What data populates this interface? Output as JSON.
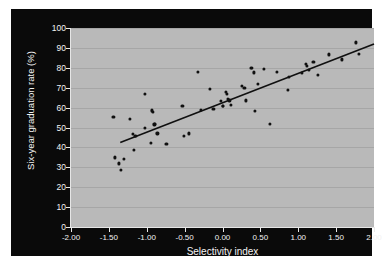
{
  "figure": {
    "background_color": "#ffffff",
    "panel_color": "#0a0a0a",
    "plot_background_color": "#b9b9b9",
    "gridline_color": "#a6a6a6",
    "text_color": "#f2f2f2",
    "marker_color": "#101010",
    "line_color": "#101010"
  },
  "chart_data": {
    "type": "scatter",
    "title": "",
    "xlabel": "Selectivity index",
    "ylabel": "Six-year graduation rate (%)",
    "xlim": [
      -2.0,
      2.0
    ],
    "ylim": [
      0,
      100
    ],
    "grid": true,
    "grid_axis": "y",
    "legend": null,
    "xticks": [
      -2.0,
      -1.5,
      -1.0,
      -0.5,
      0.0,
      0.5,
      1.0,
      1.5,
      2.0
    ],
    "xticklabels": [
      "-2.00",
      "-1.50",
      "-1.00",
      "-0.50",
      "0.00",
      "0.50",
      "1.00",
      "1.50",
      "2.00"
    ],
    "yticks": [
      0,
      10,
      20,
      30,
      40,
      50,
      60,
      70,
      80,
      90,
      100
    ],
    "yticklabels": [
      "0",
      "10",
      "20",
      "30",
      "40",
      "50",
      "60",
      "70",
      "80",
      "90",
      "100"
    ],
    "trendline": {
      "type": "linear-fit",
      "x_start": -1.35,
      "y_start": 42.5,
      "x_end": 2.0,
      "y_end": 92.0,
      "slope": 14.78,
      "intercept": 62.45
    },
    "points": [
      {
        "x": -1.44,
        "y": 55.5
      },
      {
        "x": -1.42,
        "y": 35.0
      },
      {
        "x": -1.37,
        "y": 32.0
      },
      {
        "x": -1.34,
        "y": 28.8
      },
      {
        "x": -1.3,
        "y": 34.3
      },
      {
        "x": -1.22,
        "y": 54.2
      },
      {
        "x": -1.18,
        "y": 46.8
      },
      {
        "x": -1.17,
        "y": 38.8
      },
      {
        "x": -1.16,
        "y": 45.6
      },
      {
        "x": -1.14,
        "y": 45.8
      },
      {
        "x": -1.02,
        "y": 66.8
      },
      {
        "x": -1.02,
        "y": 49.6
      },
      {
        "x": -0.95,
        "y": 42.3
      },
      {
        "x": -0.93,
        "y": 58.6
      },
      {
        "x": -0.92,
        "y": 57.8
      },
      {
        "x": -0.9,
        "y": 51.6
      },
      {
        "x": -0.89,
        "y": 52.0
      },
      {
        "x": -0.86,
        "y": 47.0
      },
      {
        "x": -0.74,
        "y": 41.9
      },
      {
        "x": -0.53,
        "y": 61.0
      },
      {
        "x": -0.51,
        "y": 45.8
      },
      {
        "x": -0.44,
        "y": 47.0
      },
      {
        "x": -0.33,
        "y": 77.9
      },
      {
        "x": -0.29,
        "y": 58.7
      },
      {
        "x": -0.17,
        "y": 69.3
      },
      {
        "x": -0.12,
        "y": 59.2
      },
      {
        "x": -0.02,
        "y": 63.2
      },
      {
        "x": 0.0,
        "y": 61.0
      },
      {
        "x": 0.01,
        "y": 60.7
      },
      {
        "x": 0.04,
        "y": 67.7
      },
      {
        "x": 0.06,
        "y": 66.9
      },
      {
        "x": 0.07,
        "y": 64.2
      },
      {
        "x": 0.09,
        "y": 63.6
      },
      {
        "x": 0.11,
        "y": 61.2
      },
      {
        "x": 0.26,
        "y": 71.1
      },
      {
        "x": 0.29,
        "y": 69.9
      },
      {
        "x": 0.31,
        "y": 63.6
      },
      {
        "x": 0.37,
        "y": 79.8
      },
      {
        "x": 0.39,
        "y": 80.0
      },
      {
        "x": 0.41,
        "y": 77.7
      },
      {
        "x": 0.43,
        "y": 58.2
      },
      {
        "x": 0.47,
        "y": 71.8
      },
      {
        "x": 0.55,
        "y": 79.6
      },
      {
        "x": 0.63,
        "y": 51.9
      },
      {
        "x": 0.72,
        "y": 78.0
      },
      {
        "x": 0.86,
        "y": 68.8
      },
      {
        "x": 0.88,
        "y": 75.5
      },
      {
        "x": 1.05,
        "y": 77.6
      },
      {
        "x": 1.1,
        "y": 81.8
      },
      {
        "x": 1.11,
        "y": 81.0
      },
      {
        "x": 1.14,
        "y": 79.1
      },
      {
        "x": 1.2,
        "y": 83.0
      },
      {
        "x": 1.26,
        "y": 76.3
      },
      {
        "x": 1.41,
        "y": 86.7
      },
      {
        "x": 1.58,
        "y": 84.2
      },
      {
        "x": 1.76,
        "y": 92.8
      },
      {
        "x": 1.8,
        "y": 86.8
      }
    ]
  }
}
